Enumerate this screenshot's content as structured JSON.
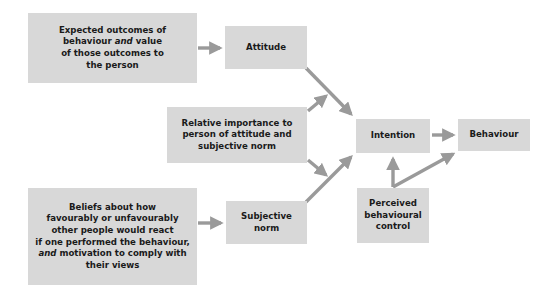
{
  "diagram": {
    "colors": {
      "box_fill": "#d8d8d8",
      "arrow": "#9a9a9a",
      "text": "#1a1a1a"
    },
    "nodes": {
      "outcomes": {
        "lines": [
          "Expected outcomes of",
          "behaviour",
          "and",
          "value",
          "of those outcomes to",
          "the person"
        ]
      },
      "attitude": {
        "label": "Attitude"
      },
      "importance": {
        "lines": [
          "Relative importance to",
          "person of attitude and",
          "subjective norm"
        ]
      },
      "beliefs": {
        "lines": [
          "Beliefs about how",
          "favourably or unfavourably",
          "other people would react",
          "if one performed the behaviour,",
          "and",
          "motivation to comply with",
          "their views"
        ]
      },
      "subjective_norm": {
        "lines": [
          "Subjective",
          "norm"
        ]
      },
      "intention": {
        "label": "Intention"
      },
      "behaviour": {
        "label": "Behaviour"
      },
      "pbc": {
        "lines": [
          "Perceived",
          "behavioural",
          "control"
        ]
      }
    },
    "edges": [
      {
        "from": "outcomes",
        "to": "attitude"
      },
      {
        "from": "beliefs",
        "to": "subjective_norm"
      },
      {
        "from": "attitude",
        "to": "intention"
      },
      {
        "from": "subjective_norm",
        "to": "intention"
      },
      {
        "from": "importance",
        "to": "attitude-intention link"
      },
      {
        "from": "importance",
        "to": "subjective_norm-intention link"
      },
      {
        "from": "intention",
        "to": "behaviour"
      },
      {
        "from": "pbc",
        "to": "intention"
      },
      {
        "from": "pbc",
        "to": "behaviour"
      }
    ]
  }
}
